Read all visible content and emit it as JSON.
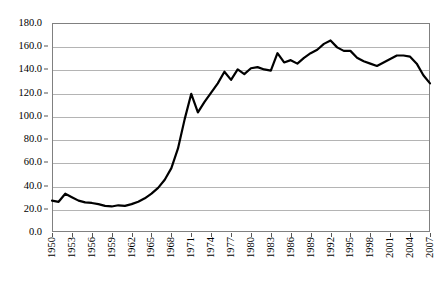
{
  "chart_data": {
    "type": "line",
    "title": "",
    "title_note": "title row is cropped off the top edge of the screenshot and is not legible",
    "xlabel": "",
    "ylabel": "",
    "ylim": [
      0.0,
      180.0
    ],
    "y_tick_step": 20.0,
    "y_ticks": [
      "0.0",
      "20.0",
      "40.0",
      "60.0",
      "80.0",
      "100.0",
      "120.0",
      "140.0",
      "160.0",
      "180.0"
    ],
    "xlim": [
      1950,
      2007
    ],
    "x_tick_labels": [
      "1950",
      "1953",
      "1956",
      "1959",
      "1962",
      "1965",
      "1968",
      "1971",
      "1974",
      "1977",
      "1980",
      "1983",
      "1986",
      "1989",
      "1992",
      "1995",
      "1998",
      "2001",
      "2004",
      "2007"
    ],
    "x_tick_step_years": 3,
    "x_tick_label_rotation_deg": 90,
    "grid": "horizontal",
    "legend": "none",
    "line_color": "#000000",
    "line_width": 2.2,
    "series": [
      {
        "name": "series-1",
        "x": [
          1950,
          1951,
          1952,
          1953,
          1954,
          1955,
          1956,
          1957,
          1958,
          1959,
          1960,
          1961,
          1962,
          1963,
          1964,
          1965,
          1966,
          1967,
          1968,
          1969,
          1970,
          1971,
          1972,
          1973,
          1974,
          1975,
          1976,
          1977,
          1978,
          1979,
          1980,
          1981,
          1982,
          1983,
          1984,
          1985,
          1986,
          1987,
          1988,
          1989,
          1990,
          1991,
          1992,
          1993,
          1994,
          1995,
          1996,
          1997,
          1998,
          1999,
          2000,
          2001,
          2002,
          2003,
          2004,
          2005,
          2006,
          2007
        ],
        "values": [
          27.0,
          26.0,
          33.0,
          30.0,
          27.0,
          25.5,
          25.0,
          24.0,
          22.5,
          22.0,
          23.0,
          22.5,
          24.0,
          26.0,
          29.0,
          33.0,
          38.0,
          45.0,
          55.0,
          72.0,
          97.0,
          119.0,
          103.0,
          112.0,
          120.0,
          128.0,
          138.0,
          131.0,
          140.0,
          136.0,
          141.0,
          142.0,
          140.0,
          139.0,
          154.0,
          146.0,
          148.0,
          145.0,
          150.0,
          154.0,
          157.0,
          162.0,
          165.0,
          159.0,
          156.0,
          156.0,
          150.0,
          147.0,
          145.0,
          143.0,
          146.0,
          149.0,
          152.0,
          152.0,
          151.0,
          145.0,
          135.0,
          128.0
        ]
      }
    ]
  }
}
